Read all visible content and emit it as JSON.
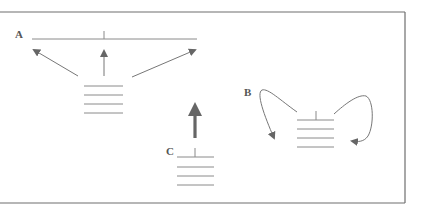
{
  "figure": {
    "labels": {
      "a": "A",
      "b": "B",
      "c": "C"
    },
    "colors": {
      "frame": "#6e6e6e",
      "line": "#8a8a8a",
      "arrow": "#666666",
      "label": "#555555"
    },
    "panels": [
      {
        "id": "A",
        "description": "Stack of four lines with three thin arrows pointing outward (left, up, right) toward a long horizontal line with a center tick"
      },
      {
        "id": "B",
        "description": "Stack of four lines with a tick on top; two curved arrows loop from the top back down into the sides of the stack"
      },
      {
        "id": "C",
        "description": "Stack of four lines with a tick on top; a single thick arrow points straight up"
      }
    ]
  }
}
